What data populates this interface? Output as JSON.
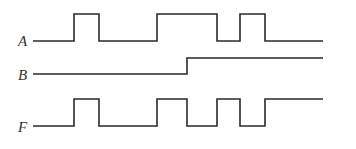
{
  "diagram": {
    "type": "timing-diagram",
    "line_color": "#2a2a2a",
    "label_color": "#333333",
    "x_start": 33,
    "x_end": 323,
    "signals": [
      {
        "name": "A",
        "label_y": 46,
        "low_y": 41,
        "high_y": 14,
        "initial": 0,
        "transitions": [
          74,
          99,
          157,
          217,
          240,
          265
        ]
      },
      {
        "name": "B",
        "label_y": 80,
        "low_y": 74,
        "high_y": 58,
        "initial": 0,
        "transitions": [
          187
        ]
      },
      {
        "name": "F",
        "label_y": 132,
        "low_y": 126,
        "high_y": 99,
        "initial": 0,
        "transitions": [
          74,
          99,
          157,
          187,
          217,
          240,
          265
        ]
      }
    ]
  }
}
